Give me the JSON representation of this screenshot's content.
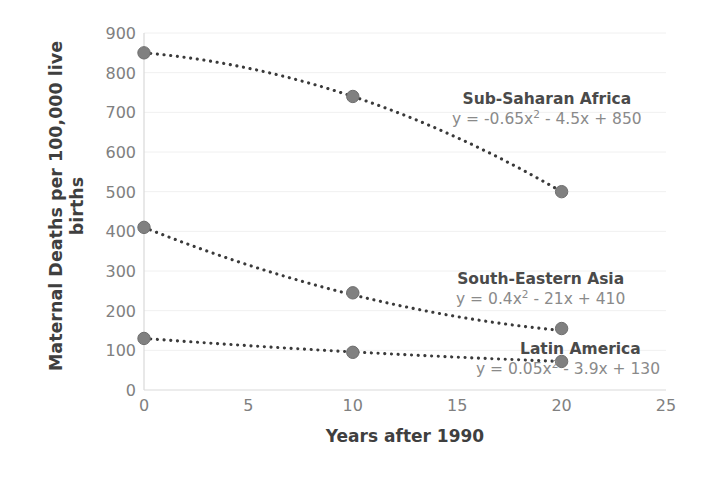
{
  "chart_data": {
    "type": "line",
    "title": "",
    "xlabel": "Years after 1990",
    "ylabel": "Maternal Deaths per 100,000 live births",
    "ylabel_line1": "Maternal Deaths per 100,000 live",
    "ylabel_line2": "births",
    "xlim": [
      0,
      25
    ],
    "ylim": [
      0,
      900
    ],
    "xticks": [
      0,
      5,
      10,
      15,
      20,
      25
    ],
    "yticks": [
      0,
      100,
      200,
      300,
      400,
      500,
      600,
      700,
      800,
      900
    ],
    "grid": "horizontal",
    "legend": "annotated-inline",
    "x": [
      0,
      10,
      20
    ],
    "series": [
      {
        "name": "Sub-Saharan Africa",
        "equation": "y = -0.65x² - 4.5x + 850",
        "equation_prefix": "y = -0.65x",
        "equation_exponent": "2",
        "equation_suffix": " - 4.5x + 850",
        "coefficients": {
          "a": -0.65,
          "b": -4.5,
          "c": 850
        },
        "values": [
          850,
          740,
          500
        ],
        "marker_color": "#808080",
        "line_color": "#3a3a3a"
      },
      {
        "name": "South-Eastern Asia",
        "equation": "y = 0.4x² - 21x + 410",
        "equation_prefix": "y = 0.4x",
        "equation_exponent": "2",
        "equation_suffix": " - 21x + 410",
        "coefficients": {
          "a": 0.4,
          "b": -21,
          "c": 410
        },
        "values": [
          410,
          245,
          155
        ],
        "marker_color": "#808080",
        "line_color": "#3a3a3a"
      },
      {
        "name": "Latin America",
        "equation": "y = 0.05x² - 3.9x + 130",
        "equation_prefix": "y = 0.05x",
        "equation_exponent": "2",
        "equation_suffix": " - 3.9x + 130",
        "coefficients": {
          "a": 0.05,
          "b": -3.9,
          "c": 130
        },
        "values": [
          130,
          95,
          72
        ],
        "marker_color": "#808080",
        "line_color": "#3a3a3a"
      }
    ],
    "colors": {
      "marker": "#808080",
      "line": "#333333",
      "grid": "#f0f0f0",
      "axis": "#d9d9d9",
      "tick_text": "#808080",
      "axis_title": "#3f3f3f",
      "series_label": "#4a4a4a",
      "equation_text": "#8a8a8a",
      "background": "#ffffff"
    }
  }
}
